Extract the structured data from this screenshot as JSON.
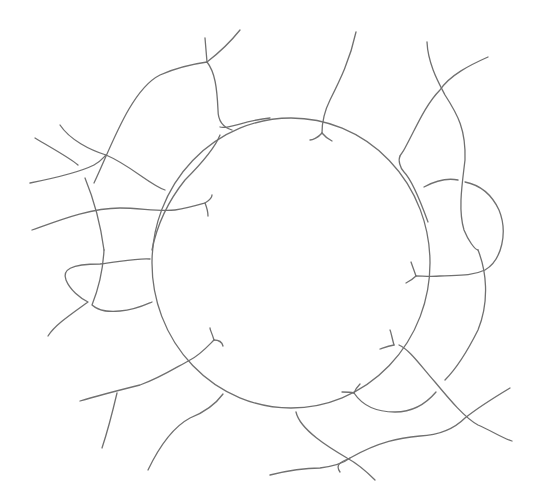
{
  "image": {
    "title": "Pencil sketch of a circle surrounded by branching filaments",
    "background": "#ffffff",
    "stroke_color": "#707070",
    "stroke_width": 1.3
  },
  "sketch": {
    "center_circle": {
      "cx": 291,
      "cy": 263,
      "rx": 139,
      "ry": 145
    },
    "filaments": [
      {
        "name": "top-left-arch",
        "d": "M 94 183 C 110 150 130 90 160 75 C 180 66 200 63 207 62 C 215 72 217 88 218 110 C 218 120 222 127 232 130"
      },
      {
        "name": "top-left-spur",
        "d": "M 207 62 C 220 52 232 40 240 30"
      },
      {
        "name": "top-left-spur-2",
        "d": "M 205 38 L 207 62"
      },
      {
        "name": "left-arch-branch",
        "d": "M 220 127 C 228 130 245 120 270 118"
      },
      {
        "name": "left-cross-1",
        "d": "M 35 138 C 55 150 70 158 78 165"
      },
      {
        "name": "left-cross-2",
        "d": "M 60 125 C 70 140 90 150 106 155 C 130 165 150 185 165 190"
      },
      {
        "name": "left-long-1",
        "d": "M 30 183 C 55 178 80 172 94 165 C 100 162 103 158 106 155"
      },
      {
        "name": "left-down-1",
        "d": "M 85 178 C 92 195 100 220 104 250"
      },
      {
        "name": "left-horizontal-hook",
        "d": "M 32 230 C 60 220 90 208 120 208 C 140 208 160 212 175 210 C 188 208 198 205 205 203"
      },
      {
        "name": "left-hook-tip-1",
        "d": "M 205 203 C 210 200 212 197 212 195"
      },
      {
        "name": "left-hook-tip-2",
        "d": "M 205 203 C 207 208 208 212 208 216"
      },
      {
        "name": "left-down-2",
        "d": "M 152 250 C 156 230 165 205 185 180 C 200 165 215 148 220 135"
      },
      {
        "name": "left-loop",
        "d": "M 150 259 C 135 258 120 262 100 264 C 70 264 62 270 66 280 C 70 290 80 298 88 302 C 70 315 55 325 48 336"
      },
      {
        "name": "left-loop-cross",
        "d": "M 104 250 C 103 270 98 290 92 305 C 100 312 110 312 120 311 C 135 310 145 305 152 302"
      },
      {
        "name": "top-center-fiber",
        "d": "M 356 32 C 350 60 340 80 330 100 C 325 110 322 120 322 133"
      },
      {
        "name": "top-center-hook-1",
        "d": "M 322 133 C 318 138 312 140 310 140"
      },
      {
        "name": "top-center-hook-2",
        "d": "M 322 133 C 326 138 330 140 332 141"
      },
      {
        "name": "top-right-junction",
        "d": "M 400 156 C 398 160 400 168 404 172 C 412 180 420 200 428 222"
      },
      {
        "name": "top-right-diag",
        "d": "M 488 57 C 470 65 450 75 440 90 C 425 105 415 130 405 148 C 403 152 401 154 400 156"
      },
      {
        "name": "top-right-long",
        "d": "M 427 42 C 428 65 440 85 445 95 C 458 115 466 130 465 160 C 462 185 458 210 464 230 C 468 240 475 250 478 250"
      },
      {
        "name": "right-loop",
        "d": "M 424 187 C 435 181 448 178 458 180 M 465 182 C 480 185 492 195 499 210 C 508 232 502 260 485 270 C 470 277 455 275 440 276 C 432 277 422 276 416 276"
      },
      {
        "name": "right-hook-1",
        "d": "M 416 276 C 414 270 412 265 411 262"
      },
      {
        "name": "right-hook-2",
        "d": "M 416 276 C 412 280 408 282 406 283"
      },
      {
        "name": "right-lower-fiber",
        "d": "M 478 250 C 486 270 490 300 478 330 C 468 350 455 370 445 380"
      },
      {
        "name": "lower-right-diag",
        "d": "M 399 345 C 410 350 420 365 435 382 C 450 400 465 418 478 425 C 490 430 502 438 512 441"
      },
      {
        "name": "lower-right-hook-1",
        "d": "M 394 345 C 392 338 391 332 390 330"
      },
      {
        "name": "lower-right-hook-2",
        "d": "M 394 345 C 388 346 383 348 380 349"
      },
      {
        "name": "bottom-arc",
        "d": "M 354 393 C 362 405 375 412 395 412 C 410 412 425 405 436 392"
      },
      {
        "name": "bottom-hook-1",
        "d": "M 354 393 C 356 388 358 386 360 384"
      },
      {
        "name": "bottom-hook-2",
        "d": "M 354 393 C 350 392 345 392 342 392"
      },
      {
        "name": "bottom-right-cross",
        "d": "M 510 388 C 490 400 475 410 465 418 C 455 428 440 435 420 436 C 400 438 380 441 350 458 C 340 462 335 465 340 472"
      },
      {
        "name": "bottom-lower-fiber",
        "d": "M 296 412 C 300 430 330 448 347 458 C 360 465 370 475 375 480"
      },
      {
        "name": "bottom-left-tail",
        "d": "M 270 475 C 290 470 305 468 320 468 C 335 466 345 462 350 458"
      },
      {
        "name": "lower-left-branch",
        "d": "M 80 401 C 100 395 120 390 140 385 C 160 378 175 368 190 360 C 200 355 208 346 214 340"
      },
      {
        "name": "lower-left-hook-1",
        "d": "M 214 340 C 212 333 210 330 210 328"
      },
      {
        "name": "lower-left-hook-2",
        "d": "M 214 340 C 218 340 222 342 223 346"
      },
      {
        "name": "lower-left-drop",
        "d": "M 117 393 C 113 410 108 430 102 448"
      },
      {
        "name": "lower-left-curve",
        "d": "M 223 394 C 215 405 205 412 190 418 C 175 426 160 445 148 470"
      }
    ]
  }
}
